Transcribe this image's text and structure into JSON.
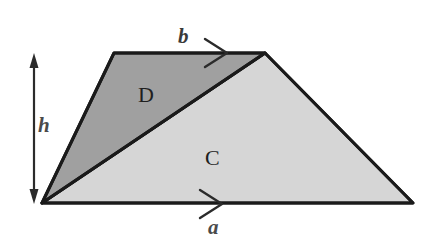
{
  "figure": {
    "background_color": "#ffffff",
    "outline_color": "#1a1a1a",
    "regions": [
      {
        "id": "D",
        "label": "D",
        "description": "upper-left triangle",
        "fill_color": "#a0a0a0",
        "vertices": [
          [
            42,
            203
          ],
          [
            114,
            53
          ],
          [
            265,
            53
          ]
        ]
      },
      {
        "id": "C",
        "label": "C",
        "description": "lower-right triangle",
        "fill_color": "#d6d6d6",
        "vertices": [
          [
            42,
            203
          ],
          [
            265,
            53
          ],
          [
            413,
            203
          ]
        ]
      }
    ],
    "dimensions": [
      {
        "id": "h",
        "label": "h",
        "style": "italic",
        "arrow": "double-vertical",
        "from": [
          34,
          56
        ],
        "to": [
          34,
          201
        ]
      },
      {
        "id": "b",
        "label": "b",
        "style": "italic",
        "arrow": "right-arrowhead",
        "edge_from": [
          114,
          53
        ],
        "edge_to": [
          265,
          53
        ]
      },
      {
        "id": "a",
        "label": "a",
        "style": "italic",
        "arrow": "right-arrowhead",
        "edge_from": [
          42,
          203
        ],
        "edge_to": [
          413,
          203
        ]
      }
    ]
  }
}
